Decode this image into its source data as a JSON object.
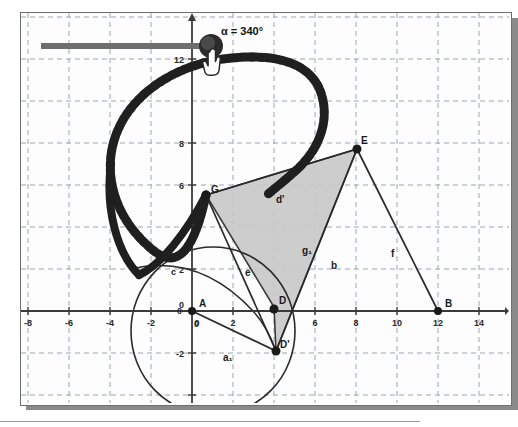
{
  "app": {
    "kind": "geometry-applet",
    "background": "#fdfdfd",
    "frame_border_color": "#6f6f6f",
    "shadow_color": "#8a8a8a"
  },
  "slider": {
    "name": "alpha-slider",
    "label": "α = 340°",
    "variable": "α",
    "value": "340",
    "unit": "°",
    "track_color": "#6e6e6e",
    "handle_color": "#2b2b2b",
    "min_label": "",
    "max_label": ""
  },
  "cursor": {
    "name": "hand-cursor",
    "type": "pointing-hand"
  },
  "axes": {
    "x_label": "x",
    "y_label": "y",
    "x_ticks": [
      "-8",
      "-6",
      "-4",
      "-2",
      "0",
      "2",
      "6",
      "8",
      "10",
      "12",
      "14"
    ],
    "x_tick_values": [
      -8,
      -6,
      -4,
      -2,
      0,
      2,
      6,
      8,
      10,
      12,
      14
    ],
    "y_ticks": [
      "12",
      "8",
      "6",
      "2",
      "0",
      "-2"
    ],
    "y_tick_values": [
      12,
      8,
      6,
      2,
      0,
      -2
    ],
    "origin_label": "0",
    "grid": "dashed",
    "grid_color": "#9aa3b2",
    "axis_color": "#3a3a3a"
  },
  "points": [
    {
      "name": "A",
      "label": "A",
      "x": 0,
      "y": 0
    },
    {
      "name": "B",
      "label": "B",
      "x": 12,
      "y": 0
    },
    {
      "name": "D",
      "label": "D",
      "x": 4,
      "y": 0.2
    },
    {
      "name": "Dp",
      "label": "D'",
      "x": 4.1,
      "y": -1.9
    },
    {
      "name": "E",
      "label": "E",
      "x": 8,
      "y": 7.9
    },
    {
      "name": "G",
      "label": "G",
      "x": 0.6,
      "y": 5.6
    },
    {
      "name": "C",
      "label": "c",
      "x": -2.1,
      "y": 2.7
    }
  ],
  "segments": [
    {
      "name": "segment-a1",
      "label": "a₁",
      "from": "A",
      "to": "D'"
    },
    {
      "name": "segment-e",
      "label": "e",
      "from": "G",
      "to": "D'"
    },
    {
      "name": "segment-b",
      "label": "b",
      "from": "D'",
      "to": "E"
    },
    {
      "name": "segment-f",
      "label": "f",
      "from": "E",
      "to": "B"
    },
    {
      "name": "segment-dprime",
      "label": "d'",
      "from": "G",
      "to": "E"
    },
    {
      "name": "segment-g1",
      "label": "g₁",
      "from": "interior",
      "to": "interior"
    }
  ],
  "labels": {
    "a1": "a₁",
    "b": "b",
    "c": "c",
    "d_prime": "d'",
    "e": "e",
    "f": "f",
    "g1": "g₁",
    "A": "A",
    "B": "B",
    "D": "D",
    "D_prime": "D'",
    "E": "E",
    "G": "G",
    "origin_zero_y": "0",
    "origin_zero_x": "0"
  },
  "polygon": {
    "name": "shaded-quadrilateral",
    "fill": "#c9c9c9",
    "stroke": "#2a2a2a",
    "vertices": [
      "G",
      "E",
      "D'",
      "D"
    ]
  },
  "circle": {
    "name": "construction-circle",
    "center_x": 1.0,
    "center_y": -1.0,
    "radius": 4.0,
    "stroke": "#2a2a2a"
  },
  "arc": {
    "name": "inner-arc",
    "stroke": "#2a2a2a"
  },
  "trace": {
    "name": "dotted-spiral-trace",
    "style": "thick-dotted",
    "color": "#1f1f1f"
  }
}
